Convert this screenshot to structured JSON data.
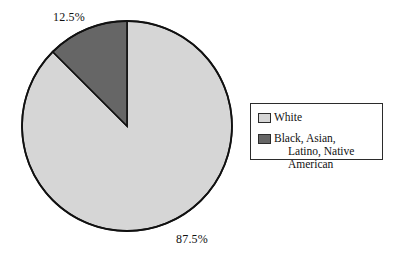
{
  "chart_data": {
    "type": "pie",
    "title": "",
    "categories": [
      "White",
      "Black, Asian, Latino, Native American"
    ],
    "values": [
      87.5,
      12.5
    ],
    "unit": "%",
    "data_labels": [
      "87.5%",
      "12.5%"
    ],
    "colors": [
      "#d6d6d6",
      "#666666"
    ],
    "legend_position": "right",
    "grid": false,
    "start_angle_deg": 0,
    "direction": "counter-clockwise",
    "slices": [
      {
        "name": "White",
        "value": 87.5,
        "label": "87.5%",
        "color": "#d6d6d6",
        "angle_deg": 315
      },
      {
        "name": "Black, Asian, Latino, Native American",
        "value": 12.5,
        "label": "12.5%",
        "color": "#666666",
        "angle_deg": 45
      }
    ]
  },
  "chart": {
    "labels": {
      "small_slice": "12.5%",
      "large_slice": "87.5%"
    },
    "geometry": {
      "center_x": 127,
      "center_y": 126,
      "radius": 105
    },
    "colors": {
      "light_slice": "#d6d6d6",
      "dark_slice": "#666666",
      "outline": "#111111",
      "background": "#ffffff"
    }
  },
  "legend": {
    "items": [
      {
        "label": "White",
        "label_line2": "",
        "swatch_color": "#d6d6d6"
      },
      {
        "label": "Black, Asian,",
        "label_line2": "Latino, Native American",
        "swatch_color": "#666666"
      }
    ]
  }
}
